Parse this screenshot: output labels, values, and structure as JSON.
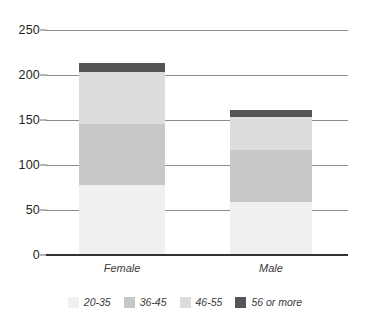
{
  "chart_data": {
    "type": "bar",
    "subtype": "stacked-bar",
    "title": "",
    "xlabel": "",
    "ylabel": "",
    "categories": [
      "Female",
      "Male"
    ],
    "series": [
      {
        "name": "20-35",
        "values": [
          78,
          59
        ],
        "color": "#f0f0f0"
      },
      {
        "name": "36-45",
        "values": [
          68,
          58
        ],
        "color": "#c8c8c8"
      },
      {
        "name": "46-55",
        "values": [
          57,
          36
        ],
        "color": "#dcdcdc"
      },
      {
        "name": "56 or more",
        "values": [
          10,
          8
        ],
        "color": "#555555"
      }
    ],
    "totals": [
      213,
      161
    ],
    "ylim": [
      0,
      250
    ],
    "yticks": [
      0,
      50,
      100,
      150,
      200,
      250
    ],
    "ytick_labels": [
      "0",
      "50",
      "100",
      "150",
      "200",
      "250"
    ],
    "grid": true,
    "legend_position": "bottom"
  },
  "axis": {
    "tick_0": "0",
    "tick_50": "50",
    "tick_100": "100",
    "tick_150": "150",
    "tick_200": "200",
    "tick_250": "250"
  },
  "categories": {
    "female": "Female",
    "male": "Male"
  },
  "legend": {
    "items": [
      {
        "label": "20-35",
        "color": "#f0f0f0"
      },
      {
        "label": "36-45",
        "color": "#c8c8c8"
      },
      {
        "label": "46-55",
        "color": "#dcdcdc"
      },
      {
        "label": "56 or more",
        "color": "#555555"
      }
    ]
  },
  "colors": {
    "gridline": "#8c8c8c",
    "baseline": "#333333",
    "text": "#231f20",
    "background": "#ffffff"
  }
}
